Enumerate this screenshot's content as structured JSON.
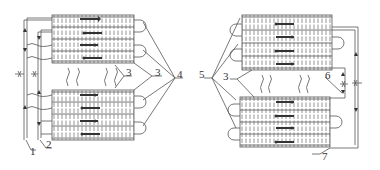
{
  "diagram": {
    "type": "technical-schematic",
    "line_color": "#555555",
    "background": "#ffffff",
    "left_assembly": {
      "labels": [
        {
          "id": "1",
          "text": "1",
          "x": 30,
          "y": 146
        },
        {
          "id": "2",
          "text": "2",
          "x": 46,
          "y": 139
        },
        {
          "id": "3a",
          "text": "3",
          "x": 128,
          "y": 70
        },
        {
          "id": "3b",
          "text": "3",
          "x": 156,
          "y": 70
        },
        {
          "id": "4",
          "text": "4",
          "x": 178,
          "y": 72
        }
      ]
    },
    "right_assembly": {
      "labels": [
        {
          "id": "5",
          "text": "5",
          "x": 197,
          "y": 72
        },
        {
          "id": "3c",
          "text": "3",
          "x": 224,
          "y": 74
        },
        {
          "id": "6",
          "text": "6",
          "x": 327,
          "y": 73
        },
        {
          "id": "7",
          "text": "7",
          "x": 326,
          "y": 152
        }
      ]
    }
  }
}
